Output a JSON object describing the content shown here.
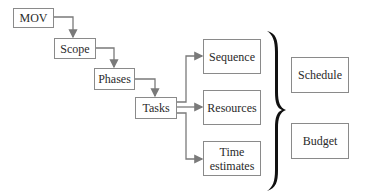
{
  "diagram": {
    "chain": [
      {
        "id": "mov",
        "label": "MOV"
      },
      {
        "id": "scope",
        "label": "Scope"
      },
      {
        "id": "phases",
        "label": "Phases"
      },
      {
        "id": "tasks",
        "label": "Tasks"
      }
    ],
    "task_outputs": [
      {
        "id": "sequence",
        "label": "Sequence"
      },
      {
        "id": "resources",
        "label": "Resources"
      },
      {
        "id": "time-estimates",
        "label": "Time estimates",
        "lines": [
          "Time",
          "estimates"
        ]
      }
    ],
    "results": [
      {
        "id": "schedule",
        "label": "Schedule"
      },
      {
        "id": "budget",
        "label": "Budget"
      }
    ],
    "colors": {
      "box_border": "#8a8a8a",
      "arrow": "#7a7a7a",
      "text": "#2a2a2a",
      "brace": "#111111"
    }
  }
}
